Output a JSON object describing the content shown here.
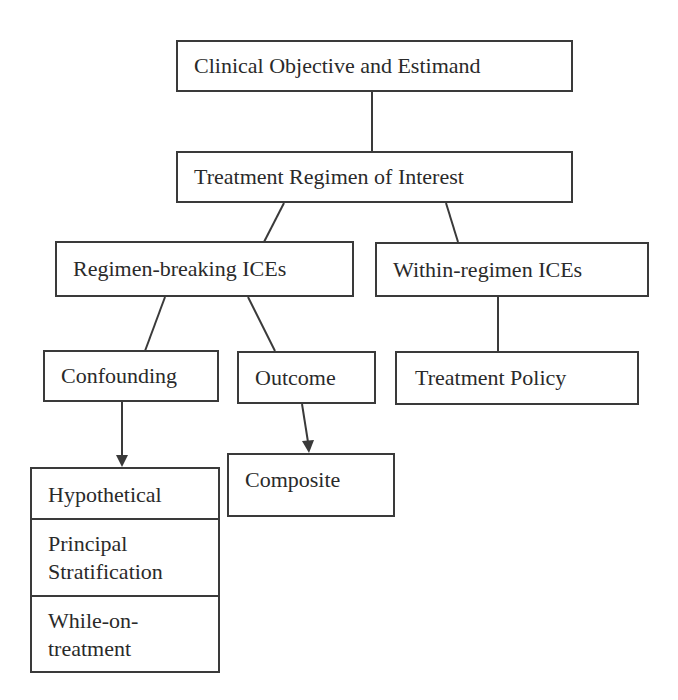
{
  "diagram": {
    "nodes": {
      "objective": {
        "label": "Clinical Objective and Estimand"
      },
      "regimen": {
        "label": "Treatment Regimen of Interest"
      },
      "regimen_breaking": {
        "label": "Regimen-breaking ICEs"
      },
      "within_regimen": {
        "label": "Within-regimen ICEs"
      },
      "confounding": {
        "label": "Confounding"
      },
      "outcome": {
        "label": "Outcome"
      },
      "treatment_policy": {
        "label": "Treatment Policy"
      },
      "composite": {
        "label": "Composite"
      },
      "strategies": {
        "items": [
          {
            "label": "Hypothetical"
          },
          {
            "line1": "Principal",
            "line2": "Stratification"
          },
          {
            "line1": "While-on-",
            "line2": "treatment"
          }
        ]
      }
    },
    "edges": [
      {
        "from": "objective",
        "to": "regimen",
        "type": "line"
      },
      {
        "from": "regimen",
        "to": "regimen_breaking",
        "type": "line"
      },
      {
        "from": "regimen",
        "to": "within_regimen",
        "type": "line"
      },
      {
        "from": "regimen_breaking",
        "to": "confounding",
        "type": "line"
      },
      {
        "from": "regimen_breaking",
        "to": "outcome",
        "type": "line"
      },
      {
        "from": "within_regimen",
        "to": "treatment_policy",
        "type": "line"
      },
      {
        "from": "confounding",
        "to": "strategies",
        "type": "arrow"
      },
      {
        "from": "outcome",
        "to": "composite",
        "type": "arrow"
      }
    ],
    "colors": {
      "stroke": "#3a3a3a",
      "background": "#ffffff",
      "text": "#2a2a2a"
    }
  }
}
